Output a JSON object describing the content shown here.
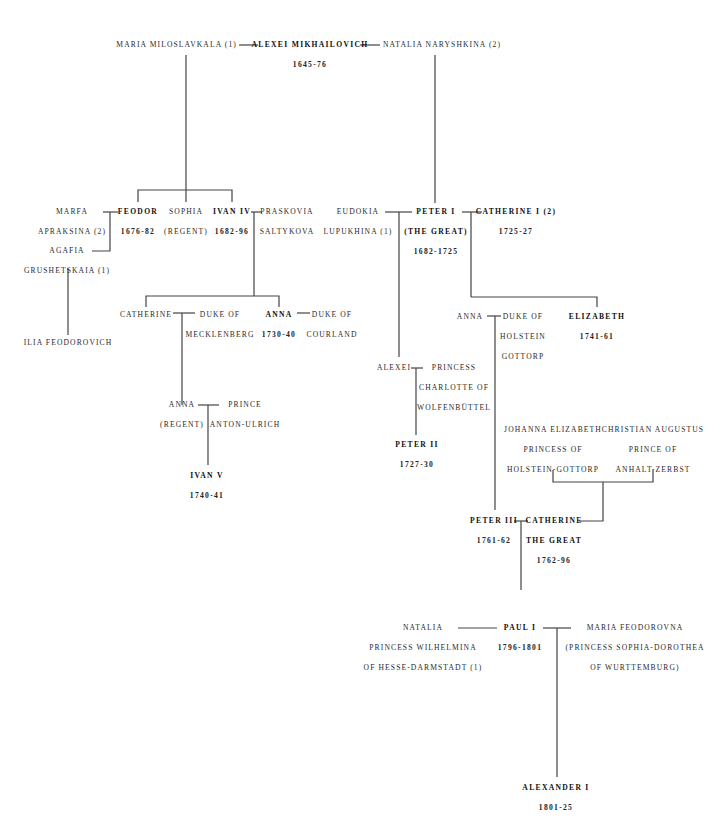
{
  "diagram": {
    "type": "family-tree",
    "line_color": "#444444",
    "ruler_style": "bold",
    "nodes": {
      "maria_miloslavkala": {
        "lines": [
          "MARIA MILOSLAVKALA (1)"
        ],
        "ruler": false
      },
      "alexei_mikhailovich": {
        "lines": [
          "ALEXEI MIKHAILOVICH"
        ],
        "reign": "1645-76",
        "ruler": true
      },
      "natalia_naryshkina": {
        "lines": [
          "NATALIA NARYSHKINA (2)"
        ],
        "ruler": false
      },
      "marfa": {
        "lines": [
          "MARFA",
          "APRAKSINA (2)"
        ],
        "ruler": false
      },
      "feodor": {
        "lines": [
          "FEODOR"
        ],
        "reign": "1676-82",
        "ruler": true
      },
      "sophia": {
        "lines": [
          "SOPHIA",
          "(REGENT)"
        ],
        "ruler": false
      },
      "ivan_iv": {
        "lines": [
          "IVAN IV"
        ],
        "reign": "1682-96",
        "ruler": true
      },
      "praskovia": {
        "lines": [
          "PRASKOVIA",
          "SALTYKOVA"
        ],
        "ruler": false
      },
      "agafia": {
        "lines": [
          "AGAFIA",
          "GRUSHETSKAIA (1)"
        ],
        "ruler": false
      },
      "ilia": {
        "lines": [
          "ILIA FEODOROVICH"
        ],
        "ruler": false
      },
      "eudokia": {
        "lines": [
          "EUDOKIA",
          "LUPUKHINA (1)"
        ],
        "ruler": false
      },
      "peter_i": {
        "lines": [
          "PETER I",
          "(THE GREAT)"
        ],
        "reign": "1682-1725",
        "ruler": true
      },
      "catherine_i": {
        "lines": [
          "CATHERINE I (2)"
        ],
        "reign": "1725-27",
        "ruler": true
      },
      "catherine_ivanovna": {
        "lines": [
          "CATHERINE"
        ],
        "ruler": false
      },
      "duke_mecklenberg": {
        "lines": [
          "DUKE OF",
          "MECKLENBERG"
        ],
        "ruler": false
      },
      "anna_ivanovna": {
        "lines": [
          "ANNA"
        ],
        "reign": "1730-40",
        "ruler": true
      },
      "duke_courland": {
        "lines": [
          "DUKE OF",
          "COURLAND"
        ],
        "ruler": false
      },
      "anna_petrovna": {
        "lines": [
          "ANNA"
        ],
        "ruler": false
      },
      "duke_holstein": {
        "lines": [
          "DUKE OF",
          "HOLSTEIN",
          "GOTTORP"
        ],
        "ruler": false
      },
      "elizabeth": {
        "lines": [
          "ELIZABETH"
        ],
        "reign": "1741-61",
        "ruler": true
      },
      "alexei_petrovich": {
        "lines": [
          "ALEXEI"
        ],
        "ruler": false
      },
      "princess_charlotte": {
        "lines": [
          "PRINCESS",
          "CHARLOTTE OF",
          "WOLFENBÜTTEL"
        ],
        "ruler": false
      },
      "anna_regent": {
        "lines": [
          "ANNA",
          "(REGENT)"
        ],
        "ruler": false
      },
      "prince_anton": {
        "lines": [
          "PRINCE",
          "ANTON-ULRICH"
        ],
        "ruler": false
      },
      "ivan_v": {
        "lines": [
          "IVAN V"
        ],
        "reign": "1740-41",
        "ruler": true
      },
      "peter_ii": {
        "lines": [
          "PETER II"
        ],
        "reign": "1727-30",
        "ruler": true
      },
      "johanna_elizabeth": {
        "lines": [
          "JOHANNA ELIZABETH",
          "PRINCESS OF",
          "HOLSTEIN-GOTTORP"
        ],
        "ruler": false
      },
      "christian_augustus": {
        "lines": [
          "CHRISTIAN AUGUSTUS",
          "PRINCE OF",
          "ANHALT-ZERBST"
        ],
        "ruler": false
      },
      "peter_iii": {
        "lines": [
          "PETER III"
        ],
        "reign": "1761-62",
        "ruler": true
      },
      "catherine_great": {
        "lines": [
          "CATHERINE",
          "THE GREAT"
        ],
        "reign": "1762-96",
        "ruler": true
      },
      "natalia_wilhelmina": {
        "lines": [
          "NATALIA",
          "PRINCESS WILHELMINA",
          "OF HESSE-DARMSTADT (1)"
        ],
        "ruler": false
      },
      "paul_i": {
        "lines": [
          "PAUL I"
        ],
        "reign": "1796-1801",
        "ruler": true
      },
      "maria_feodorovna": {
        "lines": [
          "MARIA FEODOROVNA",
          "(PRINCESS SOPHIA-DOROTHEA",
          "OF WURTTEMBURG)"
        ],
        "ruler": false
      },
      "alexander_i": {
        "lines": [
          "ALEXANDER I"
        ],
        "reign": "1801-25",
        "ruler": true
      }
    }
  }
}
